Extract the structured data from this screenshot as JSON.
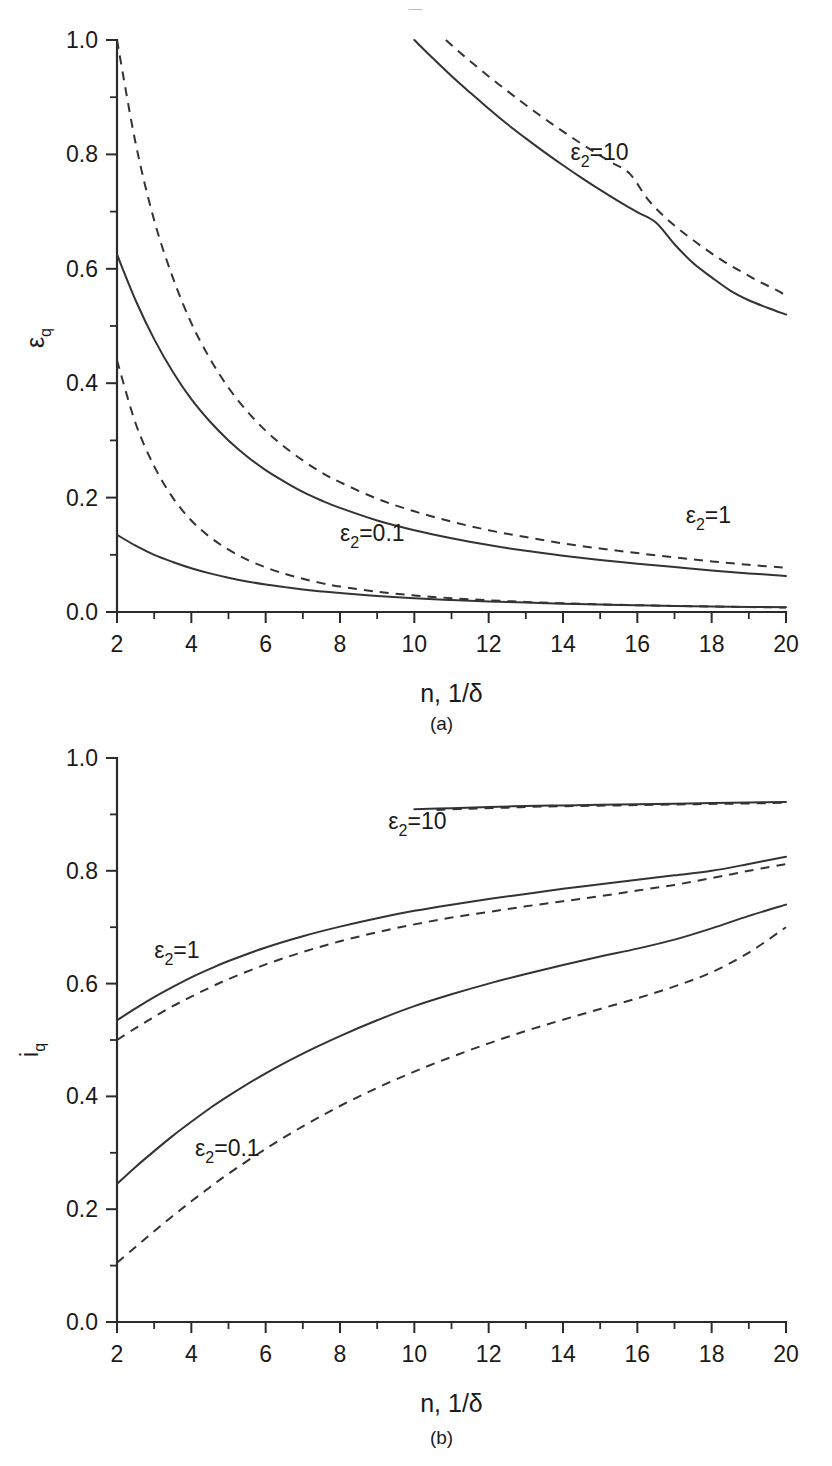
{
  "artifact": {
    "top_text": "—"
  },
  "figures": [
    {
      "id": "a",
      "caption": "(a)",
      "xlabel": "n, 1/δ",
      "ylabel_main": "ε",
      "ylabel_sub": "q",
      "chart_index": 0
    },
    {
      "id": "b",
      "caption": "(b)",
      "xlabel": "n, 1/δ",
      "ylabel_main": "i",
      "ylabel_sub": "q",
      "chart_index": 1
    }
  ],
  "chart_data": [
    {
      "type": "line",
      "title": "",
      "panel": "(a)",
      "xlabel": "n, 1/δ",
      "ylabel": "ε_q",
      "xlim": [
        2,
        20
      ],
      "ylim": [
        0.0,
        1.0
      ],
      "xticks": [
        2,
        4,
        6,
        8,
        10,
        12,
        14,
        16,
        18,
        20
      ],
      "xtick_labels": [
        "2",
        "4",
        "6",
        "8",
        "10",
        "12",
        "14",
        "16",
        "18",
        "20"
      ],
      "yticks": [
        0.0,
        0.2,
        0.4,
        0.6,
        0.8,
        1.0
      ],
      "ytick_labels": [
        "0.0",
        "0.2",
        "0.4",
        "0.6",
        "0.8",
        "1.0"
      ],
      "minor_xticks": [
        3,
        5,
        7,
        9,
        11,
        13,
        15,
        17,
        19
      ],
      "minor_yticks": [
        0.1,
        0.3,
        0.5,
        0.7,
        0.9
      ],
      "grid": false,
      "legend": "inline-annotations",
      "annotations": [
        {
          "text": "ε₂=10",
          "x": 14.2,
          "y": 0.79
        },
        {
          "text": "ε₂=1",
          "x": 17.3,
          "y": 0.155
        },
        {
          "text": "ε₂=0.1",
          "x": 8.0,
          "y": 0.125
        }
      ],
      "series": [
        {
          "name": "ε₂=10 solid",
          "style": "solid",
          "x": [
            10,
            10.5,
            11,
            11.5,
            12,
            12.5,
            13,
            13.5,
            14,
            14.5,
            15,
            15.5,
            16,
            16.5,
            17,
            17.5,
            18,
            18.5,
            19,
            19.5,
            20
          ],
          "y": [
            1.0,
            0.968,
            0.937,
            0.908,
            0.88,
            0.853,
            0.828,
            0.804,
            0.781,
            0.759,
            0.738,
            0.718,
            0.699,
            0.681,
            0.643,
            0.61,
            0.585,
            0.562,
            0.545,
            0.532,
            0.52
          ]
        },
        {
          "name": "ε₂=10 dashed",
          "style": "dashed",
          "x": [
            10.85,
            11.3,
            11.8,
            12.3,
            12.8,
            13.3,
            13.8,
            14.3,
            14.8,
            15.3,
            15.8,
            16.3,
            16.8,
            17.3,
            17.8,
            18.3,
            18.8,
            19.3,
            19.8,
            20
          ],
          "y": [
            1.0,
            0.974,
            0.947,
            0.921,
            0.896,
            0.872,
            0.849,
            0.827,
            0.806,
            0.786,
            0.766,
            0.72,
            0.687,
            0.66,
            0.636,
            0.614,
            0.595,
            0.577,
            0.561,
            0.552
          ]
        },
        {
          "name": "ε₂=1 solid",
          "style": "solid",
          "x": [
            2,
            2.5,
            3,
            3.5,
            4,
            4.5,
            5,
            5.5,
            6,
            6.5,
            7,
            7.5,
            8,
            9,
            10,
            11,
            12,
            13,
            14,
            15,
            16,
            17,
            18,
            19,
            20
          ],
          "y": [
            0.625,
            0.545,
            0.477,
            0.42,
            0.372,
            0.333,
            0.3,
            0.272,
            0.248,
            0.228,
            0.21,
            0.195,
            0.182,
            0.16,
            0.143,
            0.129,
            0.117,
            0.107,
            0.0985,
            0.091,
            0.0845,
            0.0785,
            0.0725,
            0.0675,
            0.063
          ]
        },
        {
          "name": "ε₂=1 dashed",
          "style": "dashed",
          "x": [
            2,
            2.5,
            3,
            3.5,
            4,
            4.5,
            5,
            5.5,
            6,
            6.5,
            7,
            7.5,
            8,
            9,
            10,
            11,
            12,
            13,
            14,
            15,
            16,
            17,
            18,
            19,
            20
          ],
          "y": [
            1.0,
            0.82,
            0.685,
            0.585,
            0.505,
            0.443,
            0.392,
            0.351,
            0.317,
            0.289,
            0.265,
            0.244,
            0.227,
            0.198,
            0.176,
            0.158,
            0.143,
            0.131,
            0.12,
            0.111,
            0.103,
            0.0955,
            0.0885,
            0.0825,
            0.0775
          ]
        },
        {
          "name": "ε₂=0.1 solid",
          "style": "solid",
          "x": [
            2,
            2.5,
            3,
            3.5,
            4,
            4.5,
            5,
            5.5,
            6,
            6.5,
            7,
            7.5,
            8,
            9,
            10,
            11,
            12,
            13,
            14,
            15,
            16,
            17,
            18,
            19,
            20
          ],
          "y": [
            0.135,
            0.116,
            0.1,
            0.0875,
            0.0765,
            0.0675,
            0.06,
            0.0535,
            0.048,
            0.0435,
            0.0395,
            0.036,
            0.033,
            0.028,
            0.024,
            0.021,
            0.0185,
            0.0165,
            0.0145,
            0.013,
            0.0118,
            0.0107,
            0.0097,
            0.0089,
            0.0082
          ]
        },
        {
          "name": "ε₂=0.1 dashed",
          "style": "dashed",
          "x": [
            2,
            2.5,
            3,
            3.5,
            4,
            4.5,
            5,
            5.5,
            6,
            6.5,
            7,
            7.5,
            8,
            9,
            10,
            11,
            12,
            13,
            14,
            15,
            16,
            17,
            18,
            19,
            20
          ],
          "y": [
            0.44,
            0.33,
            0.255,
            0.2,
            0.16,
            0.131,
            0.109,
            0.0915,
            0.078,
            0.067,
            0.058,
            0.0505,
            0.0445,
            0.0355,
            0.029,
            0.0242,
            0.0205,
            0.0176,
            0.0153,
            0.0134,
            0.0119,
            0.0106,
            0.0095,
            0.0086,
            0.0078
          ]
        }
      ]
    },
    {
      "type": "line",
      "title": "",
      "panel": "(b)",
      "xlabel": "n, 1/δ",
      "ylabel": "i_q",
      "xlim": [
        2,
        20
      ],
      "ylim": [
        0.0,
        1.0
      ],
      "xticks": [
        2,
        4,
        6,
        8,
        10,
        12,
        14,
        16,
        18,
        20
      ],
      "xtick_labels": [
        "2",
        "4",
        "6",
        "8",
        "10",
        "12",
        "14",
        "16",
        "18",
        "20"
      ],
      "yticks": [
        0.0,
        0.2,
        0.4,
        0.6,
        0.8,
        1.0
      ],
      "ytick_labels": [
        "0.0",
        "0.2",
        "0.4",
        "0.6",
        "0.8",
        "1.0"
      ],
      "minor_xticks": [
        3,
        5,
        7,
        9,
        11,
        13,
        15,
        17,
        19
      ],
      "minor_yticks": [
        0.1,
        0.3,
        0.5,
        0.7,
        0.9
      ],
      "grid": false,
      "legend": "inline-annotations",
      "annotations": [
        {
          "text": "ε₂=10",
          "x": 9.3,
          "y": 0.875
        },
        {
          "text": "ε₂=1",
          "x": 3.0,
          "y": 0.645
        },
        {
          "text": "ε₂=0.1",
          "x": 4.1,
          "y": 0.295
        }
      ],
      "series": [
        {
          "name": "ε₂=10 solid",
          "style": "solid",
          "x": [
            10,
            11,
            12,
            13,
            14,
            15,
            16,
            17,
            18,
            19,
            20
          ],
          "y": [
            0.909,
            0.911,
            0.913,
            0.915,
            0.916,
            0.917,
            0.918,
            0.919,
            0.92,
            0.921,
            0.922
          ]
        },
        {
          "name": "ε₂=10 dashed",
          "style": "dashed",
          "x": [
            10.6,
            11.5,
            12.5,
            13.5,
            14.5,
            15.5,
            16.5,
            17.5,
            18.5,
            19.5,
            20
          ],
          "y": [
            0.908,
            0.91,
            0.912,
            0.914,
            0.915,
            0.916,
            0.917,
            0.918,
            0.919,
            0.92,
            0.921
          ]
        },
        {
          "name": "ε₂=1 solid",
          "style": "solid",
          "x": [
            2,
            2.5,
            3,
            3.5,
            4,
            4.5,
            5,
            6,
            7,
            8,
            9,
            10,
            11,
            12,
            13,
            14,
            15,
            16,
            17,
            18,
            19,
            20
          ],
          "y": [
            0.535,
            0.556,
            0.576,
            0.594,
            0.611,
            0.626,
            0.64,
            0.664,
            0.684,
            0.701,
            0.716,
            0.729,
            0.74,
            0.75,
            0.759,
            0.768,
            0.776,
            0.784,
            0.792,
            0.8,
            0.812,
            0.825
          ]
        },
        {
          "name": "ε₂=1 dashed",
          "style": "dashed",
          "x": [
            2,
            2.5,
            3,
            3.5,
            4,
            4.5,
            5,
            6,
            7,
            8,
            9,
            10,
            11,
            12,
            13,
            14,
            15,
            16,
            17,
            18,
            19,
            20
          ],
          "y": [
            0.5,
            0.521,
            0.541,
            0.56,
            0.577,
            0.593,
            0.608,
            0.634,
            0.656,
            0.675,
            0.691,
            0.705,
            0.717,
            0.727,
            0.737,
            0.746,
            0.755,
            0.765,
            0.775,
            0.787,
            0.8,
            0.812
          ]
        },
        {
          "name": "ε₂=0.1 solid",
          "style": "solid",
          "x": [
            2,
            2.5,
            3,
            3.5,
            4,
            4.5,
            5,
            6,
            7,
            8,
            9,
            10,
            11,
            12,
            13,
            14,
            15,
            16,
            17,
            18,
            19,
            20
          ],
          "y": [
            0.245,
            0.275,
            0.303,
            0.33,
            0.355,
            0.379,
            0.401,
            0.441,
            0.476,
            0.507,
            0.535,
            0.56,
            0.581,
            0.6,
            0.617,
            0.633,
            0.648,
            0.662,
            0.678,
            0.698,
            0.72,
            0.74
          ]
        },
        {
          "name": "ε₂=0.1 dashed",
          "style": "dashed",
          "x": [
            2,
            2.5,
            3,
            3.5,
            4,
            4.5,
            5,
            6,
            7,
            8,
            9,
            10,
            11,
            12,
            13,
            14,
            15,
            16,
            17,
            18,
            19,
            20
          ],
          "y": [
            0.105,
            0.133,
            0.161,
            0.188,
            0.214,
            0.239,
            0.263,
            0.307,
            0.347,
            0.383,
            0.415,
            0.444,
            0.47,
            0.494,
            0.516,
            0.536,
            0.555,
            0.574,
            0.595,
            0.62,
            0.655,
            0.7
          ]
        }
      ]
    }
  ]
}
